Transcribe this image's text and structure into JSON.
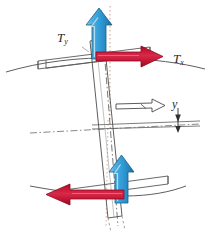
{
  "figure": {
    "background": "#ffffff",
    "width": 222,
    "height": 236
  },
  "labels": {
    "force_vertical": {
      "symbol": "T",
      "subscript": "y",
      "name": "T_y"
    },
    "force_horizontal": {
      "symbol": "T",
      "subscript": "x",
      "name": "T_x"
    },
    "dimension_y": {
      "symbol": "y",
      "subscript": "",
      "name": "y"
    }
  },
  "colors": {
    "blue_arrow_fill": "#2f9ad6",
    "blue_arrow_light": "#79c2e8",
    "blue_arrow_dark": "#1b6f9e",
    "blue_arrow_stroke": "#1a5f88",
    "red_arrow_fill": "#cc1535",
    "red_arrow_light": "#e35a75",
    "red_arrow_dark": "#8d0b22",
    "red_arrow_stroke": "#8d0b22",
    "line_gray": "#5a5a5a",
    "line_light": "#8a8a8a",
    "dash_dot": "#6b6b6b",
    "dotted_warm": "#c08a70",
    "outline_arrow_stroke": "#4a4a4a",
    "text": "#2b2b2b"
  },
  "elements": {
    "ground_line_top": {
      "name": "ground-surface-curve-top",
      "type": "curve"
    },
    "ground_line_bottom": {
      "name": "ground-surface-curve-bottom",
      "type": "curve"
    },
    "slab_top": {
      "name": "slab-plate-top",
      "type": "outlined-plate"
    },
    "slab_bottom": {
      "name": "slab-plate-bottom",
      "type": "outlined-plate"
    },
    "pile": {
      "name": "pile-shaft",
      "type": "tilted-rectangle"
    },
    "centerline_pile": {
      "name": "pile-centerline",
      "type": "dash-dot"
    },
    "centerline_vertical": {
      "name": "vertical-reference-dotted",
      "type": "dotted"
    },
    "centerline_horizontal": {
      "name": "horizontal-reference-dash-dot",
      "type": "dash-dot"
    },
    "displacement_arrow": {
      "name": "displacement-arrow-hollow",
      "type": "outlined-arrow"
    },
    "dimension_arrow_y": {
      "name": "dimension-arrow-y",
      "type": "double-headed-arrow"
    },
    "arrow_top_vertical": {
      "name": "force-arrow-ty-top",
      "direction": "up",
      "color": "blue"
    },
    "arrow_top_horizontal": {
      "name": "force-arrow-tx-top",
      "direction": "right",
      "color": "red"
    },
    "arrow_bottom_vertical": {
      "name": "force-arrow-ty-bottom",
      "direction": "up",
      "color": "blue"
    },
    "arrow_bottom_horizontal": {
      "name": "force-arrow-tx-bottom",
      "direction": "left",
      "color": "red"
    }
  }
}
